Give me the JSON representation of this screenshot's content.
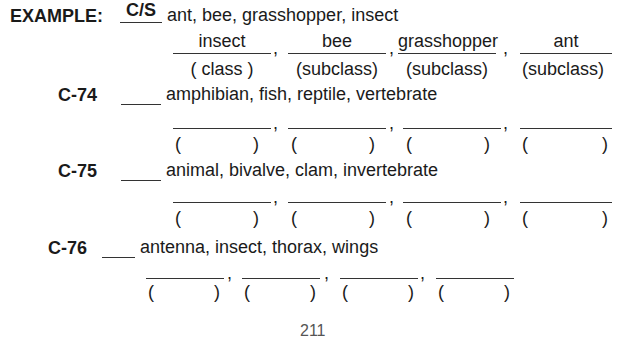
{
  "example": {
    "label": "EXAMPLE:",
    "answer": "C/S",
    "terms": "ant, bee, grasshopper, insect",
    "answers": [
      "insect",
      "bee",
      "grasshopper",
      "ant"
    ],
    "classes": [
      "( class )",
      "(subclass)",
      "(subclass)",
      "(subclass)"
    ]
  },
  "items": [
    {
      "label": "C-74",
      "terms": "amphibian, fish, reptile, vertebrate"
    },
    {
      "label": "C-75",
      "terms": "animal, bivalve, clam, invertebrate"
    },
    {
      "label": "C-76",
      "terms": "antenna, insect, thorax, wings"
    }
  ],
  "separators": {
    "comma": ",",
    "paren_open": "(",
    "paren_close": ")"
  },
  "page_number": "211"
}
